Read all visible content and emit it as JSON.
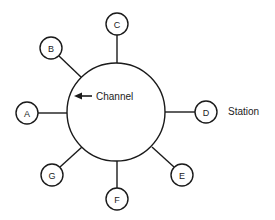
{
  "diagram": {
    "type": "star/ring network topology",
    "channel": {
      "label": "Channel",
      "center": [
        116,
        112
      ],
      "radius": 49
    },
    "station_label": "Station",
    "stations": [
      {
        "id": "A",
        "label": "A",
        "cx": 27,
        "cy": 113,
        "attach": [
          67,
          113
        ]
      },
      {
        "id": "B",
        "label": "B",
        "cx": 51,
        "cy": 48,
        "attach": [
          82,
          77
        ]
      },
      {
        "id": "C",
        "label": "C",
        "cx": 117,
        "cy": 24,
        "attach": [
          117,
          63
        ]
      },
      {
        "id": "D",
        "label": "D",
        "cx": 206,
        "cy": 112,
        "attach": [
          165,
          112
        ]
      },
      {
        "id": "E",
        "label": "E",
        "cx": 182,
        "cy": 175,
        "attach": [
          152,
          147
        ]
      },
      {
        "id": "F",
        "label": "F",
        "cx": 117,
        "cy": 199,
        "attach": [
          117,
          161
        ]
      },
      {
        "id": "G",
        "label": "G",
        "cx": 52,
        "cy": 175,
        "attach": [
          82,
          147
        ]
      }
    ],
    "node_radius": 11,
    "colors": {
      "stroke": "#1a1a1a",
      "text": "#222222",
      "background": "#ffffff"
    }
  }
}
